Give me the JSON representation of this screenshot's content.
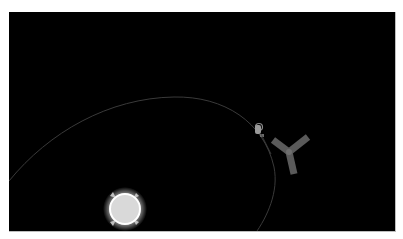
{
  "caption": {
    "text": ""
  },
  "scene": {
    "background_color": "#000000",
    "orbit": {
      "color": "#3a3a3a",
      "description": "elliptical orbit path"
    },
    "sun": {
      "label": "sun",
      "fill": "#d9d9d9",
      "glow": "#ffffff",
      "cx": 116,
      "cy": 197,
      "r": 15
    },
    "astronaut": {
      "label": "astronaut",
      "color": "#9a9a9a",
      "x": 246,
      "y": 112
    },
    "y_object": {
      "label": "y-shaped satellite",
      "color": "#5a5a5a",
      "center_x": 280,
      "center_y": 140
    }
  }
}
